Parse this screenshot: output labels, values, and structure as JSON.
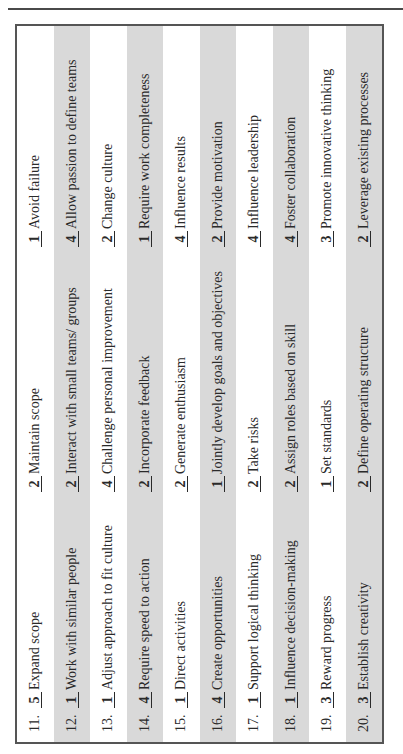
{
  "rows": [
    {
      "num": "11.",
      "items": [
        {
          "score": "5",
          "label": "Expand scope"
        },
        {
          "score": "2",
          "label": "Maintain scope"
        },
        {
          "score": "1",
          "label": "Avoid failure"
        }
      ]
    },
    {
      "num": "12.",
      "items": [
        {
          "score": "1",
          "label": "Work with similar people"
        },
        {
          "score": "2",
          "label": "Interact with small teams/ groups"
        },
        {
          "score": "4",
          "label": "Allow passion to define teams"
        }
      ]
    },
    {
      "num": "13.",
      "items": [
        {
          "score": "1",
          "label": "Adjust approach to fit culture"
        },
        {
          "score": "4",
          "label": "Challenge personal improvement"
        },
        {
          "score": "2",
          "label": "Change culture"
        }
      ]
    },
    {
      "num": "14.",
      "items": [
        {
          "score": "4",
          "label": "Require speed to action"
        },
        {
          "score": "2",
          "label": "Incorporate feedback"
        },
        {
          "score": "1",
          "label": "Require work completeness"
        }
      ]
    },
    {
      "num": "15.",
      "items": [
        {
          "score": "1",
          "label": "Direct activities"
        },
        {
          "score": "2",
          "label": "Generate enthusiasm"
        },
        {
          "score": "4",
          "label": "Influence results"
        }
      ]
    },
    {
      "num": "16.",
      "items": [
        {
          "score": "4",
          "label": "Create opportunities"
        },
        {
          "score": "1",
          "label": "Jointly develop goals and objectives"
        },
        {
          "score": "2",
          "label": "Provide motivation"
        }
      ]
    },
    {
      "num": "17.",
      "items": [
        {
          "score": "1",
          "label": "Support logical thinking"
        },
        {
          "score": "2",
          "label": "Take risks"
        },
        {
          "score": "4",
          "label": "Influence leadership"
        }
      ]
    },
    {
      "num": "18.",
      "items": [
        {
          "score": "1",
          "label": "Influence decision-making"
        },
        {
          "score": "2",
          "label": "Assign roles based on skill"
        },
        {
          "score": "4",
          "label": "Foster collaboration"
        }
      ]
    },
    {
      "num": "19.",
      "items": [
        {
          "score": "3",
          "label": "Reward progress"
        },
        {
          "score": "1",
          "label": "Set standards"
        },
        {
          "score": "3",
          "label": "Promote innovative thinking"
        }
      ]
    },
    {
      "num": "20.",
      "items": [
        {
          "score": "3",
          "label": "Establish creativity"
        },
        {
          "score": "2",
          "label": "Define operating structure"
        },
        {
          "score": "2",
          "label": "Leverage existing processes"
        }
      ]
    }
  ]
}
